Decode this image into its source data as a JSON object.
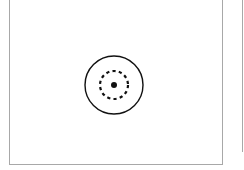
{
  "canvas": {
    "background": "#ffffff",
    "border_color": "#a8a8a8"
  },
  "main_panel": {
    "target_icon": {
      "name": "target-icon",
      "outer_ring": {
        "style": "solid",
        "radius": 29,
        "color": "#111111"
      },
      "inner_ring": {
        "style": "dashed",
        "radius": 14,
        "color": "#111111"
      },
      "center_dot": {
        "radius": 3,
        "color": "#111111"
      }
    }
  },
  "right_panel": {
    "visible": "partial-edge"
  }
}
